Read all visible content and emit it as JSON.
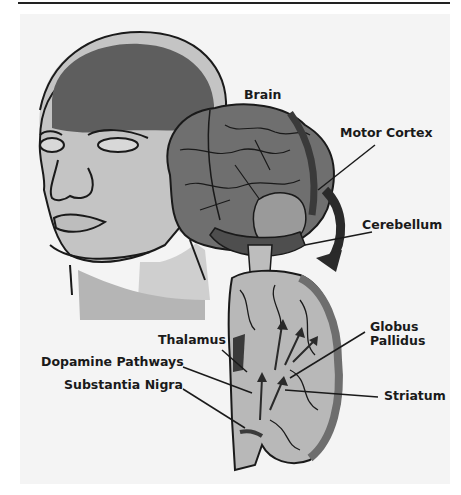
{
  "figure": {
    "colors": {
      "background": "#ffffff",
      "panel": "#f4f4f4",
      "line": "#1a1a1a",
      "brain_dark": "#5a5a5a",
      "brain_mid": "#8a8a8a",
      "brain_light": "#b8b8b8",
      "skin": "#c8c8c8"
    },
    "labels": {
      "brain": "Brain",
      "motor_cortex": "Motor Cortex",
      "cerebellum": "Cerebellum",
      "thalamus": "Thalamus",
      "globus_pallidus_1": "Globus",
      "globus_pallidus_2": "Pallidus",
      "dopamine_pathways": "Dopamine Pathways",
      "substantia_nigra": "Substantia Nigra",
      "striatum": "Striatum"
    }
  }
}
